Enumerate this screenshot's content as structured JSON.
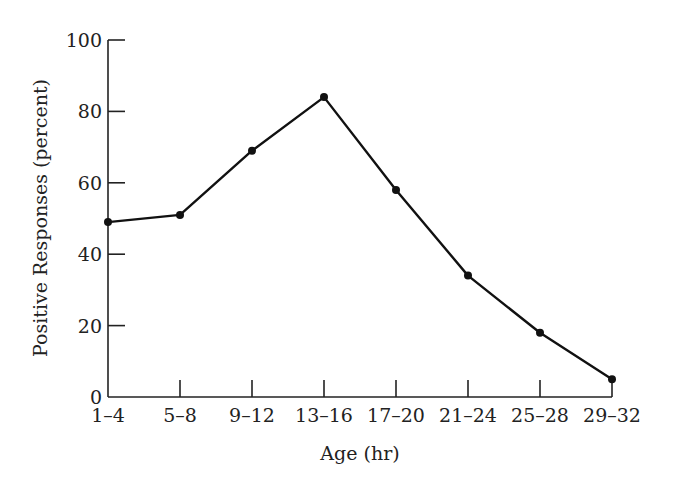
{
  "chart_data": {
    "type": "line",
    "title": "",
    "xlabel": "Age (hr)",
    "ylabel": "Positive Responses (percent)",
    "categories": [
      "1–4",
      "5–8",
      "9–12",
      "13–16",
      "17–20",
      "21–24",
      "25–28",
      "29–32"
    ],
    "series": [
      {
        "name": "Positive Responses",
        "values": [
          49,
          51,
          69,
          84,
          58,
          34,
          18,
          5
        ]
      }
    ],
    "ylim": [
      0,
      100
    ],
    "yticks": [
      0,
      20,
      40,
      60,
      80,
      100
    ],
    "grid": false,
    "legend": null,
    "markers": "filled-circle"
  },
  "colors": {
    "line": "#111111",
    "axis": "#222222",
    "background": "#ffffff"
  }
}
